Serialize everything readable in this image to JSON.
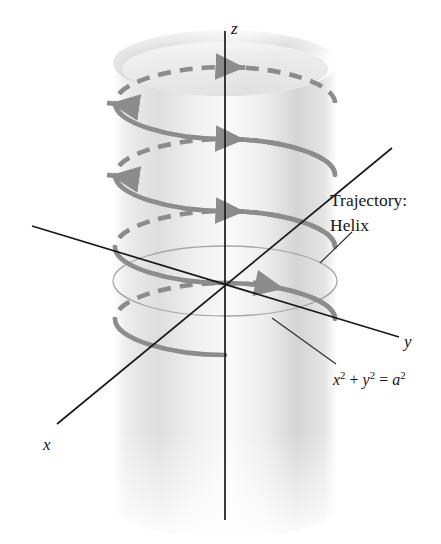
{
  "figure": {
    "kind": "3d-vector-diagram",
    "background_color": "#ffffff",
    "axes": {
      "color": "#1a1a1a",
      "origin": {
        "x": 225,
        "y": 281
      },
      "labels": {
        "x": "x",
        "y": "y",
        "z": "z"
      },
      "label_positions": {
        "x": {
          "x": 43,
          "y": 436
        },
        "y": {
          "x": 404,
          "y": 333
        },
        "z": {
          "x": 231,
          "y": 20
        }
      }
    },
    "cylinder": {
      "color_light": "#f2f2f2",
      "color_mid": "#d8d8d8",
      "color_dark": "#c4c4c4",
      "center_x": 225,
      "radius_x": 112,
      "ellipse_ry": 33,
      "top_y": 63,
      "bottom_y": 505
    },
    "base_circle": {
      "color": "#a9a9a9",
      "center": {
        "x": 225,
        "y": 281
      },
      "rx": 112,
      "ry": 35
    },
    "helix": {
      "color": "#8c8c8c",
      "stroke_width": 4.5,
      "turns": 3.5,
      "pitch_px": 72,
      "center_x": 225,
      "radius_x": 110,
      "ellipse_ry": 32,
      "start_y": 85,
      "front_style": "solid",
      "back_style": "dashed",
      "dash_pattern": "13 9",
      "direction": "counterclockwise-from-above-descending",
      "arrowheads": 7
    },
    "callouts": [
      {
        "name": "trajectory",
        "line1": "Trajectory:",
        "line2": "Helix",
        "x": 330,
        "y": 192
      },
      {
        "name": "cylinder-equation",
        "text": "x2 + y2 = a2",
        "x": 333,
        "y": 370
      }
    ],
    "equation": {
      "x_var": "x",
      "y_var": "y",
      "a_var": "a",
      "exp": "2",
      "plus": "+",
      "equals": "="
    },
    "leader_lines": [
      {
        "name": "trajectory-leader",
        "x1": 352,
        "y1": 232,
        "x2": 320,
        "y2": 263
      },
      {
        "name": "equation-leader",
        "x1": 272,
        "y1": 318,
        "x2": 336,
        "y2": 364
      }
    ]
  }
}
